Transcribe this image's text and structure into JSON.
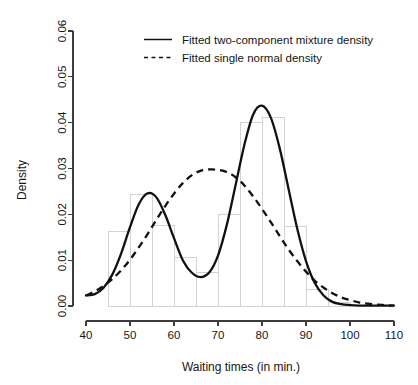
{
  "chart_data": {
    "type": "line",
    "title": "",
    "xlabel": "Waiting times (in min.)",
    "ylabel": "Density",
    "xlim": [
      40,
      110
    ],
    "ylim": [
      0.0,
      0.06
    ],
    "xticks": [
      "40",
      "50",
      "60",
      "70",
      "80",
      "90",
      "100",
      "110"
    ],
    "xtick_values": [
      40,
      50,
      60,
      70,
      80,
      90,
      100,
      110
    ],
    "yticks": [
      "0.00",
      "0.01",
      "0.02",
      "0.03",
      "0.04",
      "0.05",
      "0.06"
    ],
    "ytick_values": [
      0.0,
      0.01,
      0.02,
      0.03,
      0.04,
      0.05,
      0.06
    ],
    "grid": false,
    "legend_position": "top-center",
    "legend": [
      {
        "label": "Fitted two-component mixture density",
        "style": "solid"
      },
      {
        "label": "Fitted single normal density",
        "style": "dashed"
      }
    ],
    "histogram": {
      "bin_width": 5,
      "bin_edges": [
        40,
        45,
        50,
        55,
        60,
        65,
        70,
        75,
        80,
        85,
        90,
        95,
        100
      ],
      "densities": [
        0.0,
        0.0162,
        0.0243,
        0.0176,
        0.0106,
        0.0074,
        0.0199,
        0.04,
        0.0412,
        0.0173,
        0.0037,
        0.0007
      ],
      "fill_color": "#ffffff",
      "border_color": "#d2d2d2"
    },
    "series": [
      {
        "name": "Fitted two-component mixture density",
        "style": "solid",
        "color": "#111111",
        "peaks": [
          {
            "x": 54.5,
            "y": 0.0247
          },
          {
            "x": 80.0,
            "y": 0.0437
          }
        ],
        "trough": {
          "x": 66.0,
          "y": 0.0063
        },
        "x": [
          40,
          42,
          44,
          46,
          48,
          50,
          52,
          54,
          56,
          58,
          60,
          62,
          64,
          66,
          68,
          70,
          72,
          74,
          76,
          78,
          80,
          82,
          84,
          86,
          88,
          90,
          92,
          94,
          96,
          98,
          100,
          102,
          104,
          106,
          108,
          110
        ],
        "y": [
          0.0023,
          0.0026,
          0.004,
          0.0069,
          0.0115,
          0.0172,
          0.0222,
          0.0246,
          0.0237,
          0.0199,
          0.0148,
          0.01,
          0.0073,
          0.0063,
          0.0073,
          0.011,
          0.0177,
          0.0264,
          0.0352,
          0.0418,
          0.0437,
          0.0411,
          0.0345,
          0.0257,
          0.0169,
          0.0098,
          0.005,
          0.0023,
          0.0009,
          0.0004,
          0.0002,
          0.0001,
          0.0001,
          0.0001,
          0.0001,
          0.0001
        ]
      },
      {
        "name": "Fitted single normal density",
        "style": "dashed",
        "color": "#111111",
        "mean": 71.0,
        "peak": {
          "x": 71.0,
          "y": 0.0297
        },
        "x": [
          40,
          42,
          44,
          46,
          48,
          50,
          52,
          54,
          56,
          58,
          60,
          62,
          64,
          66,
          68,
          70,
          72,
          74,
          76,
          78,
          80,
          82,
          84,
          86,
          88,
          90,
          92,
          94,
          96,
          98,
          100,
          102,
          104,
          106,
          108,
          110
        ],
        "y": [
          0.0023,
          0.0032,
          0.0044,
          0.0059,
          0.0078,
          0.0101,
          0.0128,
          0.0157,
          0.0188,
          0.0218,
          0.0245,
          0.0268,
          0.0285,
          0.0295,
          0.0298,
          0.0297,
          0.0292,
          0.0281,
          0.0263,
          0.0239,
          0.0212,
          0.0183,
          0.0153,
          0.0124,
          0.0098,
          0.0075,
          0.0055,
          0.004,
          0.0028,
          0.0019,
          0.0013,
          0.0008,
          0.0005,
          0.0003,
          0.0002,
          0.0001
        ]
      }
    ]
  }
}
